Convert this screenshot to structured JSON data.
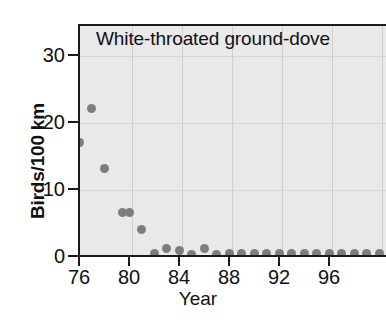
{
  "chart_data": {
    "type": "scatter",
    "title": "White-throated ground-dove",
    "xlabel": "Year",
    "ylabel": "Birds/100 km",
    "xlim": [
      76,
      100.5
    ],
    "ylim": [
      0,
      34.5
    ],
    "grid": true,
    "legend": null,
    "marker_color": "#7d7d7d",
    "plot_background": "#e9e9e9",
    "xticks": [
      "76",
      "80",
      "84",
      "88",
      "92",
      "96"
    ],
    "xtick_values": [
      76,
      80,
      84,
      88,
      92,
      96
    ],
    "yticks": [
      "0",
      "10",
      "20",
      "30"
    ],
    "ytick_values": [
      0,
      10,
      20,
      30
    ],
    "x": [
      76,
      77,
      78,
      79.5,
      80,
      81,
      82,
      83,
      84,
      85,
      86,
      87,
      88,
      89,
      90,
      91,
      92,
      93,
      94,
      95,
      96,
      97,
      98,
      99,
      100
    ],
    "values": [
      17,
      22,
      13,
      6.5,
      6.5,
      4,
      0.4,
      1.1,
      0.8,
      0.2,
      1.1,
      0.2,
      0.3,
      0.3,
      0.3,
      0.3,
      0.3,
      0.3,
      0.4,
      0.4,
      0.4,
      0.4,
      0.4,
      0.4,
      0.4
    ]
  }
}
